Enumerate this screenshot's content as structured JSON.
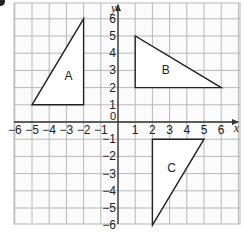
{
  "diagram": {
    "x_axis_label": "x",
    "y_axis_label": "y",
    "origin_label": "0",
    "x_ticks": [
      "-6",
      "-5",
      "-4",
      "-3",
      "-2",
      "-1",
      "1",
      "2",
      "3",
      "4",
      "5",
      "6"
    ],
    "y_ticks": [
      "6",
      "5",
      "4",
      "3",
      "2",
      "1",
      "-1",
      "-2",
      "-3",
      "-4",
      "-5",
      "-6"
    ],
    "grid": {
      "x_min": -6,
      "x_max": 7,
      "y_min": -6,
      "y_max": 7
    },
    "shapes": [
      {
        "label": "A",
        "vertices": [
          [
            -5,
            1
          ],
          [
            -2,
            1
          ],
          [
            -2,
            6
          ]
        ]
      },
      {
        "label": "B",
        "vertices": [
          [
            1,
            2
          ],
          [
            1,
            5
          ],
          [
            6,
            2
          ]
        ]
      },
      {
        "label": "C",
        "vertices": [
          [
            2,
            -1
          ],
          [
            5,
            -1
          ],
          [
            2,
            -6
          ]
        ]
      }
    ],
    "colors": {
      "grid": "#b8b8b8",
      "axis": "#333333",
      "shape": "#222222",
      "text": "#222222"
    }
  }
}
